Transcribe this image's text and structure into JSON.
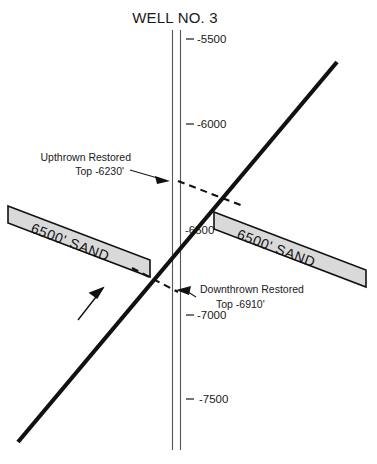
{
  "figure": {
    "title": "WELL NO. 3",
    "background_color": "#ffffff",
    "line_color": "#111111",
    "sand_fill_color": "#d9d9d9",
    "wellbore_color": "#555555"
  },
  "depth_scale": {
    "unit": "feet subsea",
    "ticks": [
      {
        "label": "-5500",
        "value": -5500
      },
      {
        "label": "-6000",
        "value": -6000
      },
      {
        "label": "-6500",
        "value": -6500
      },
      {
        "label": "-7000",
        "value": -7000
      },
      {
        "label": "-7500",
        "value": -7500
      }
    ]
  },
  "wellbore": {
    "name": "WELL NO. 3",
    "label": "WELL NO. 3"
  },
  "sand_bodies": [
    {
      "id": "upthrown-sand",
      "label": "6500' SAND",
      "block": "upthrown",
      "position": "left"
    },
    {
      "id": "downthrown-sand",
      "label": "6500' SAND",
      "block": "downthrown",
      "position": "right"
    }
  ],
  "annotations": [
    {
      "id": "upthrown-restored",
      "line1": "Upthrown  Restored",
      "line2": "Top -6230'",
      "depth": -6230,
      "arrow_direction": "right"
    },
    {
      "id": "downthrown-restored",
      "line1": "Downthrown  Restored",
      "line2": "Top -6910'",
      "depth": -6910,
      "arrow_direction": "left"
    }
  ],
  "fault": {
    "id": "normal-fault",
    "slip_arrow": "up-to-the-right"
  }
}
